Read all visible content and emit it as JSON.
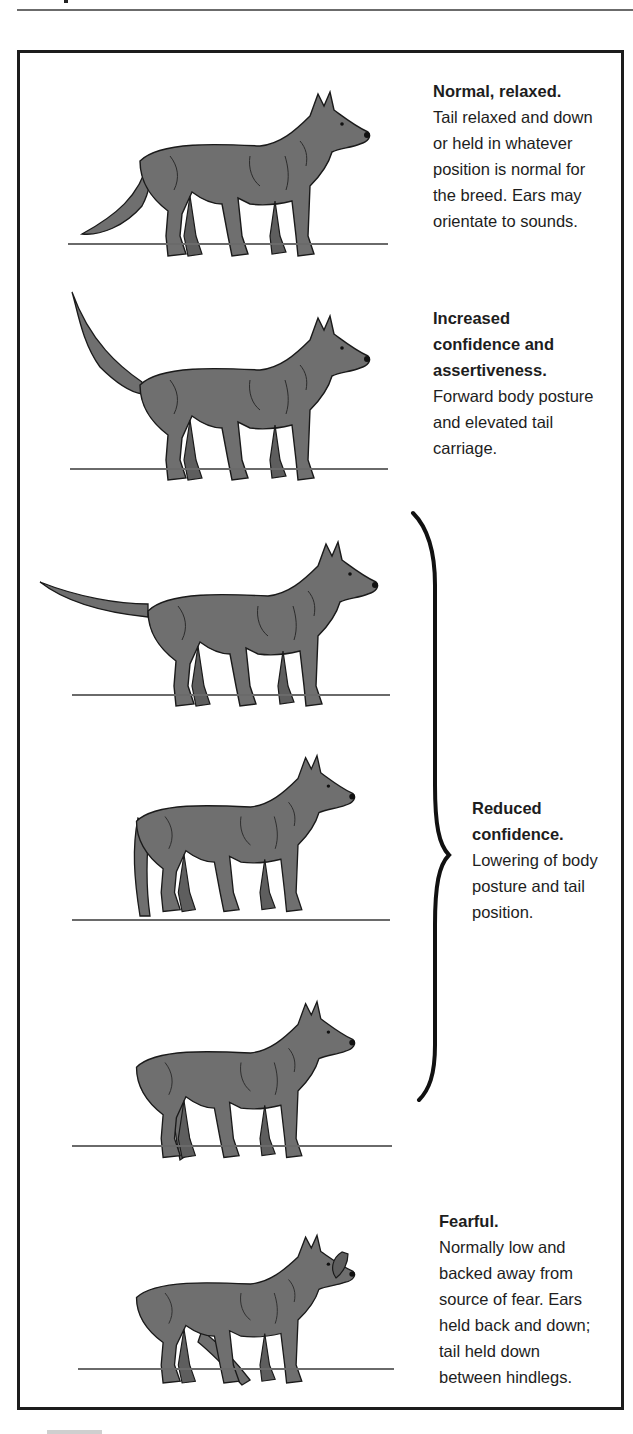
{
  "figure": {
    "colors": {
      "dog_fill": "#6f6f6f",
      "dog_outline": "#1a1a1a",
      "ground_line": "#6a6a6a",
      "frame_border": "#1c1c1c",
      "text": "#1d1d1d"
    },
    "panels": [
      {
        "id": "normal-relaxed",
        "title": "Normal, relaxed.",
        "lines": [
          "Tail relaxed and down",
          "or held in whatever",
          "position is normal for",
          "the breed. Ears may",
          "orientate to sounds."
        ]
      },
      {
        "id": "increased-confidence",
        "title_lines": [
          "Increased",
          "confidence and",
          "assertiveness."
        ],
        "lines": [
          "Forward body posture",
          "and elevated tail",
          "carriage."
        ]
      },
      {
        "id": "reduced-confidence",
        "title_lines": [
          "Reduced",
          "confidence."
        ],
        "lines": [
          "Lowering of body",
          "posture and tail",
          "position."
        ],
        "bracket_spans_dogs": 3
      },
      {
        "id": "fearful",
        "title": "Fearful.",
        "lines": [
          "Normally low and",
          "backed away from",
          "source of fear. Ears",
          "held back and down;",
          "tail held down",
          "between hindlegs."
        ]
      }
    ],
    "dogs": [
      {
        "posture": "normal-relaxed",
        "tail": "relaxed-down",
        "ears": "erect"
      },
      {
        "posture": "increased-confidence",
        "tail": "elevated",
        "ears": "erect-forward"
      },
      {
        "posture": "reduced-confidence-1",
        "tail": "horizontal",
        "ears": "erect"
      },
      {
        "posture": "reduced-confidence-2",
        "tail": "lowered",
        "ears": "erect"
      },
      {
        "posture": "reduced-confidence-3",
        "tail": "tucked-low",
        "ears": "partially-back"
      },
      {
        "posture": "fearful",
        "tail": "between-hindlegs",
        "ears": "back-and-down"
      }
    ]
  }
}
